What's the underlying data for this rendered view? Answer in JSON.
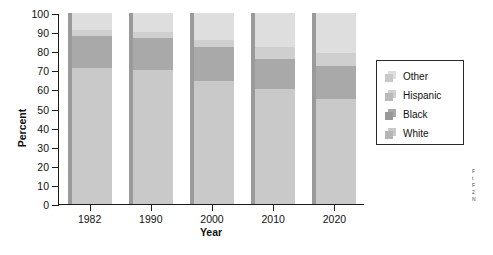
{
  "chart_data": {
    "type": "bar",
    "subtype": "stacked-bar",
    "title": "",
    "xlabel": "Year",
    "ylabel": "Percent",
    "categories": [
      "1982",
      "1990",
      "2000",
      "2010",
      "2020"
    ],
    "ylim": [
      0,
      100
    ],
    "yticks": [
      0,
      10,
      20,
      30,
      40,
      50,
      60,
      70,
      80,
      90,
      100
    ],
    "grid": false,
    "legend_position": "right",
    "legend_entries": [
      "Other",
      "Hispanic",
      "Black",
      "White"
    ],
    "stack_order_bottom_to_top": [
      "White",
      "Black",
      "Hispanic",
      "Other"
    ],
    "series": [
      {
        "name": "White",
        "color": "#c9c9c9",
        "values": [
          71,
          70,
          64.5,
          60,
          55
        ]
      },
      {
        "name": "Black",
        "color": "#a9a9a9",
        "values": [
          17,
          17,
          17.5,
          16,
          17
        ]
      },
      {
        "name": "Hispanic",
        "color": "#cfcfcf",
        "values": [
          3,
          3,
          4,
          6,
          7
        ]
      },
      {
        "name": "Other",
        "color": "#dedede",
        "values": [
          9,
          10,
          14,
          18,
          21
        ]
      }
    ],
    "cumulative_tops": {
      "White": [
        71,
        70,
        64.5,
        60,
        55
      ],
      "Black": [
        88,
        87,
        82,
        76,
        72
      ],
      "Hispanic": [
        91,
        90,
        86,
        82,
        79
      ],
      "Other": [
        100,
        100,
        100,
        100,
        100
      ]
    }
  },
  "axes": {
    "y_title": "Percent",
    "x_title": "Year",
    "y_tick_labels": [
      "100",
      "90",
      "80",
      "70",
      "60",
      "50",
      "40",
      "30",
      "20",
      "10",
      "0"
    ],
    "x_tick_labels": [
      "1982",
      "1990",
      "2000",
      "2010",
      "2020"
    ]
  },
  "legend": {
    "items": [
      {
        "label": "Other",
        "color": "#dedede"
      },
      {
        "label": "Hispanic",
        "color": "#cfcfcf"
      },
      {
        "label": "Black",
        "color": "#a9a9a9"
      },
      {
        "label": "White",
        "color": "#c9c9c9"
      }
    ]
  },
  "caption_sliver": {
    "lines": [
      "F",
      "t",
      "F",
      "2",
      "",
      "N"
    ]
  },
  "colors": {
    "axis": "#1a1a1a",
    "bar_shadow": "#9a9a9a",
    "background": "#ffffff",
    "legend_border": "#2a2a2a"
  }
}
